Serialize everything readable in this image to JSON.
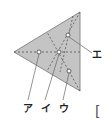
{
  "figure": {
    "type": "triangle-diagram",
    "fill_color": "#c4c4c4",
    "stroke_color": "#888888",
    "dashed_color": "#555555",
    "triangle": {
      "left": [
        14,
        52
      ],
      "top": [
        80,
        12
      ],
      "bottom": [
        80,
        91
      ]
    },
    "points": [
      {
        "id": "a",
        "label": "ア",
        "x": 39,
        "y": 52
      },
      {
        "id": "i",
        "label": "イ",
        "x": 59,
        "y": 52
      },
      {
        "id": "u",
        "label": "ウ",
        "x": 69,
        "y": 71
      },
      {
        "id": "e",
        "label": "エ",
        "x": 68,
        "y": 35
      }
    ]
  },
  "labels": {
    "a": "ア",
    "i": "イ",
    "u": "ウ",
    "e": "エ"
  },
  "answer_bracket": "["
}
